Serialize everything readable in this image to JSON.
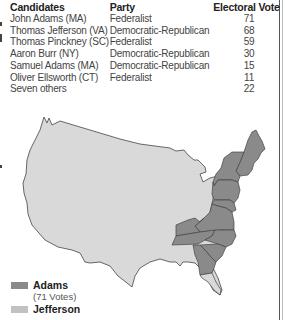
{
  "table": {
    "headers": {
      "candidates": "Candidates",
      "party": "Party",
      "vote": "Electoral Vote"
    },
    "rows": [
      {
        "candidate": "John Adams (MA)",
        "party": "Federalist",
        "vote": "71"
      },
      {
        "candidate": "Thomas Jefferson (VA)",
        "party": "Democratic-Republican",
        "vote": "68"
      },
      {
        "candidate": "Thomas Pinckney (SC)",
        "party": "Federalist",
        "vote": "59"
      },
      {
        "candidate": "Aaron Burr (NY)",
        "party": "Democratic-Republican",
        "vote": "30"
      },
      {
        "candidate": "Samuel Adams (MA)",
        "party": "Democratic-Republican",
        "vote": "15"
      },
      {
        "candidate": "Oliver Ellsworth (CT)",
        "party": "Federalist",
        "vote": "11"
      },
      {
        "candidate": "Seven others",
        "party": "",
        "vote": "22"
      }
    ]
  },
  "legend": {
    "adams": {
      "label": "Adams",
      "sub": "(71 Votes)",
      "color": "#8a8a8a"
    },
    "jefferson": {
      "label": "Jefferson",
      "color": "#c2c2c2"
    }
  },
  "map": {
    "land_color": "#d9d9d9",
    "adams_color": "#8a8a8a",
    "jefferson_color": "#b5b5b5",
    "outline_color": "#444444"
  }
}
